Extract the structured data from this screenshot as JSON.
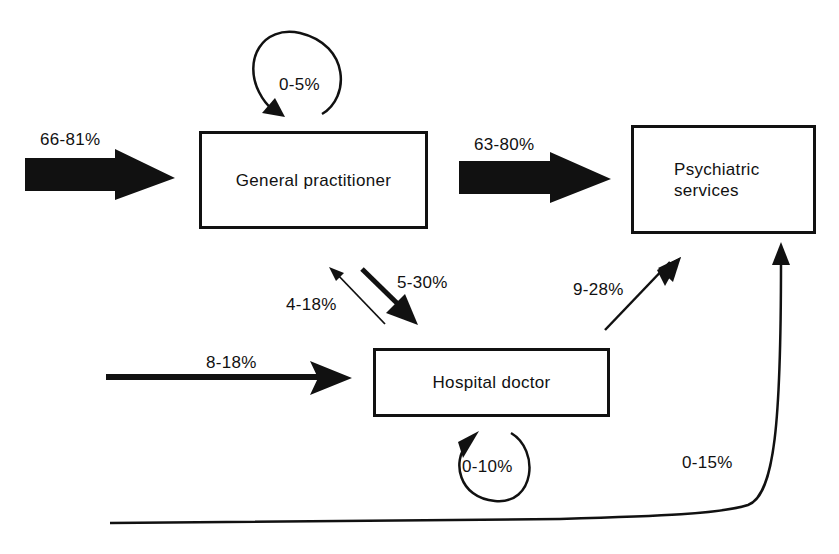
{
  "nodes": {
    "general_practitioner": "General practitioner",
    "psychiatric_services_line1": "Psychiatric",
    "psychiatric_services_line2": "services",
    "hospital_doctor": "Hospital doctor"
  },
  "flows": {
    "into_gp": "66-81%",
    "gp_self_loop": "0-5%",
    "gp_to_psychiatric": "63-80%",
    "gp_to_hospital": "5-30%",
    "hospital_to_gp": "4-18%",
    "into_hospital": "8-18%",
    "hospital_to_psychiatric": "9-28%",
    "hospital_self_loop": "0-10%",
    "direct_to_psychiatric": "0-15%"
  },
  "colors": {
    "ink": "#111111",
    "background": "#ffffff"
  }
}
